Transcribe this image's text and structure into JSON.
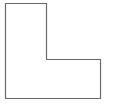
{
  "canvas": {
    "width": 114,
    "height": 104,
    "background": "#ffffff"
  },
  "shape": {
    "kind": "L-shape polygon outline",
    "points": "5.5,3.5 46.5,3.5 46.5,59.5 100.5,59.5 100.5,98.5 5.5,98.5",
    "stroke": "#6a6a6a",
    "stroke_width": "1.2",
    "fill": "none"
  }
}
